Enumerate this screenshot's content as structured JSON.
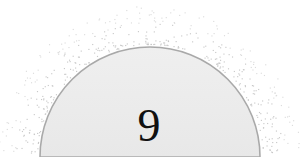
{
  "canvas": {
    "width": 301,
    "height": 157,
    "background_color": "#ffffff"
  },
  "badge": {
    "label": "9",
    "label_color": "#111111",
    "label_font_size_px": 46,
    "label_center_x": 149,
    "label_baseline_y": 140,
    "shape": "semicircle-dome",
    "center_x": 150,
    "center_y": 157,
    "radius": 110,
    "fill_color_top": "#efefef",
    "fill_color_bottom": "#e8e8e8",
    "stroke_color": "#a9a9a9",
    "stroke_width": 1.6,
    "left_edge_x": 40,
    "right_edge_x": 260,
    "apex_y": 34
  },
  "halo": {
    "description": "scattered speckle dots forming a glow ring outside the dome arc",
    "dot_color": "#c9c9c9",
    "dot_color_faint": "#dcdcdc",
    "dot_size_px": 1.15,
    "inner_radius": 113,
    "outer_radius": 152,
    "dot_count": 430,
    "angle_start_deg": 178,
    "angle_end_deg": 2
  }
}
